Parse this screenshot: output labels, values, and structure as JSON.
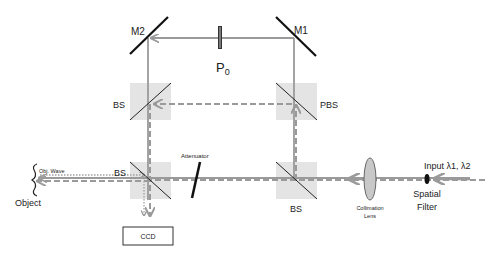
{
  "diagram": {
    "components": {
      "mirror_m1": "M1",
      "mirror_m2": "M2",
      "polarizer": "P",
      "polarizer_subscript": "0",
      "bs_upper_left": "BS",
      "pbs_upper_right": "PBS",
      "bs_lower_left": "BS",
      "bs_lower_right": "BS",
      "attenuator": "Attenuator",
      "collimation_lens_line1": "Collimation",
      "collimation_lens_line2": "Lens",
      "spatial_filter_line1": "Spatial",
      "spatial_filter_line2": "Filter",
      "input": "Input λ1, λ2",
      "object": "Object",
      "object_wave": "Obj. Wave",
      "ccd": "CCD"
    },
    "colors": {
      "beam": "#9a9a9a",
      "component": "#111111",
      "splitter_box": "#e4e4e4",
      "lens_fill": "#c8c8c8"
    }
  }
}
